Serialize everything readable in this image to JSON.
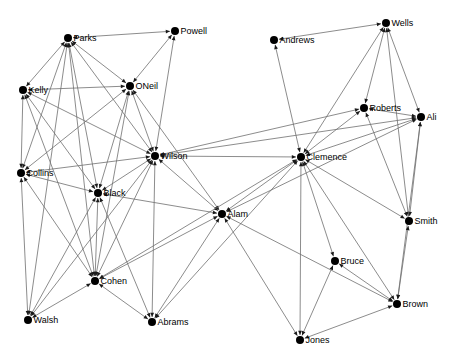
{
  "canvas": {
    "width": 451,
    "height": 358,
    "background": "#ffffff"
  },
  "graph": {
    "type": "node-link-network",
    "edge_color": "#6e6e6e",
    "arrow_color": "#1a1a1a",
    "node_color": "#000000",
    "label_color": "#000000",
    "node_radius": 4,
    "label_font_size": 9,
    "edges_bidirectional": true,
    "nodes": [
      {
        "id": "Parks",
        "label": "Parks",
        "x": 68,
        "y": 38
      },
      {
        "id": "Powell",
        "label": "Powell",
        "x": 175,
        "y": 31
      },
      {
        "id": "Wells",
        "label": "Wells",
        "x": 386,
        "y": 23
      },
      {
        "id": "Andrews",
        "label": "Andrews",
        "x": 274,
        "y": 40
      },
      {
        "id": "ONeil",
        "label": "ONeil",
        "x": 130,
        "y": 86
      },
      {
        "id": "Kelly",
        "label": "Kelly",
        "x": 23,
        "y": 90
      },
      {
        "id": "Roberts",
        "label": "Roberts",
        "x": 364,
        "y": 108
      },
      {
        "id": "Ali",
        "label": "Ali",
        "x": 421,
        "y": 117
      },
      {
        "id": "Wilson",
        "label": "Wilson",
        "x": 155,
        "y": 156
      },
      {
        "id": "Clemence",
        "label": "Clemence",
        "x": 301,
        "y": 157
      },
      {
        "id": "Collins",
        "label": "Collins",
        "x": 21,
        "y": 173
      },
      {
        "id": "Black",
        "label": "Black",
        "x": 98,
        "y": 193
      },
      {
        "id": "Alam",
        "label": "Alam",
        "x": 222,
        "y": 214
      },
      {
        "id": "Smith",
        "label": "Smith",
        "x": 409,
        "y": 221
      },
      {
        "id": "Bruce",
        "label": "Bruce",
        "x": 335,
        "y": 261
      },
      {
        "id": "Cohen",
        "label": "Cohen",
        "x": 95,
        "y": 281
      },
      {
        "id": "Brown",
        "label": "Brown",
        "x": 397,
        "y": 304
      },
      {
        "id": "Walsh",
        "label": "Walsh",
        "x": 28,
        "y": 320
      },
      {
        "id": "Abrams",
        "label": "Abrams",
        "x": 152,
        "y": 322
      },
      {
        "id": "Jones",
        "label": "Jones",
        "x": 300,
        "y": 340
      }
    ],
    "edges": [
      [
        "Parks",
        "Powell"
      ],
      [
        "Parks",
        "Kelly"
      ],
      [
        "Parks",
        "ONeil"
      ],
      [
        "Parks",
        "Wilson"
      ],
      [
        "Parks",
        "Collins"
      ],
      [
        "Parks",
        "Black"
      ],
      [
        "Parks",
        "Cohen"
      ],
      [
        "Parks",
        "Walsh"
      ],
      [
        "Powell",
        "ONeil"
      ],
      [
        "Powell",
        "Wilson"
      ],
      [
        "Kelly",
        "ONeil"
      ],
      [
        "Kelly",
        "Collins"
      ],
      [
        "Kelly",
        "Wilson"
      ],
      [
        "Kelly",
        "Black"
      ],
      [
        "Kelly",
        "Cohen"
      ],
      [
        "ONeil",
        "Wilson"
      ],
      [
        "ONeil",
        "Collins"
      ],
      [
        "ONeil",
        "Black"
      ],
      [
        "ONeil",
        "Cohen"
      ],
      [
        "ONeil",
        "Alam"
      ],
      [
        "Collins",
        "Wilson"
      ],
      [
        "Collins",
        "Black"
      ],
      [
        "Collins",
        "Cohen"
      ],
      [
        "Collins",
        "Walsh"
      ],
      [
        "Wilson",
        "Black"
      ],
      [
        "Wilson",
        "Cohen"
      ],
      [
        "Wilson",
        "Walsh"
      ],
      [
        "Wilson",
        "Abrams"
      ],
      [
        "Wilson",
        "Alam"
      ],
      [
        "Wilson",
        "Clemence"
      ],
      [
        "Wilson",
        "Roberts"
      ],
      [
        "Wilson",
        "Ali"
      ],
      [
        "Black",
        "Cohen"
      ],
      [
        "Black",
        "Walsh"
      ],
      [
        "Black",
        "Abrams"
      ],
      [
        "Black",
        "Alam"
      ],
      [
        "Cohen",
        "Walsh"
      ],
      [
        "Cohen",
        "Abrams"
      ],
      [
        "Cohen",
        "Alam"
      ],
      [
        "Cohen",
        "Clemence"
      ],
      [
        "Abrams",
        "Alam"
      ],
      [
        "Abrams",
        "Clemence"
      ],
      [
        "Alam",
        "Clemence"
      ],
      [
        "Alam",
        "Ali"
      ],
      [
        "Alam",
        "Jones"
      ],
      [
        "Alam",
        "Brown"
      ],
      [
        "Clemence",
        "Andrews"
      ],
      [
        "Clemence",
        "Wells"
      ],
      [
        "Clemence",
        "Roberts"
      ],
      [
        "Clemence",
        "Ali"
      ],
      [
        "Clemence",
        "Smith"
      ],
      [
        "Clemence",
        "Brown"
      ],
      [
        "Clemence",
        "Jones"
      ],
      [
        "Clemence",
        "Bruce"
      ],
      [
        "Andrews",
        "Wells"
      ],
      [
        "Wells",
        "Roberts"
      ],
      [
        "Wells",
        "Ali"
      ],
      [
        "Wells",
        "Smith"
      ],
      [
        "Roberts",
        "Ali"
      ],
      [
        "Roberts",
        "Smith"
      ],
      [
        "Ali",
        "Smith"
      ],
      [
        "Ali",
        "Brown"
      ],
      [
        "Smith",
        "Brown"
      ],
      [
        "Bruce",
        "Jones"
      ],
      [
        "Bruce",
        "Brown"
      ],
      [
        "Jones",
        "Brown"
      ]
    ]
  }
}
